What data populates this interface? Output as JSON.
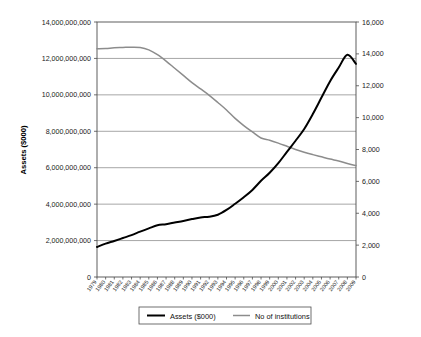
{
  "chart_data": {
    "type": "line",
    "title": "",
    "xlabel": "",
    "ylabel": "Assets ($000)",
    "y2label": "",
    "grid": true,
    "legend_position": "bottom",
    "ylim": [
      0,
      14000000000
    ],
    "y2lim": [
      0,
      16000
    ],
    "categories": [
      "1979",
      "1980",
      "1981",
      "1982",
      "1983",
      "1984",
      "1985",
      "1986",
      "1987",
      "1988",
      "1989",
      "1990",
      "1991",
      "1992",
      "1993",
      "1994",
      "1995",
      "1996",
      "1997",
      "1998",
      "1999",
      "2000",
      "2001",
      "2002",
      "2003",
      "2004",
      "2005",
      "2006",
      "2007",
      "2008",
      "2009"
    ],
    "ytick_labels": [
      "0",
      "2,000,000,000",
      "4,000,000,000",
      "6,000,000,000",
      "8,000,000,000",
      "10,000,000,000",
      "12,000,000,000",
      "14,000,000,000"
    ],
    "ytick_values": [
      0,
      2000000000,
      4000000000,
      6000000000,
      8000000000,
      10000000000,
      12000000000,
      14000000000
    ],
    "y2tick_labels": [
      "0",
      "2,000",
      "4,000",
      "6,000",
      "8,000",
      "10,000",
      "12,000",
      "14,000",
      "16,000"
    ],
    "y2tick_values": [
      0,
      2000,
      4000,
      6000,
      8000,
      10000,
      12000,
      14000,
      16000
    ],
    "series": [
      {
        "name": "Assets ($000)",
        "axis": "left",
        "color": "#000000",
        "values": [
          1650000000,
          1830000000,
          1980000000,
          2140000000,
          2300000000,
          2490000000,
          2670000000,
          2840000000,
          2900000000,
          2990000000,
          3080000000,
          3180000000,
          3270000000,
          3310000000,
          3420000000,
          3680000000,
          4020000000,
          4380000000,
          4780000000,
          5280000000,
          5720000000,
          6250000000,
          6870000000,
          7480000000,
          8130000000,
          8950000000,
          9850000000,
          10750000000,
          11500000000,
          12200000000,
          11700000000
        ]
      },
      {
        "name": "No of institutions",
        "axis": "right",
        "color": "#8c8c8c",
        "values": [
          14320,
          14340,
          14380,
          14400,
          14420,
          14400,
          14250,
          13950,
          13550,
          13100,
          12650,
          12200,
          11800,
          11400,
          10950,
          10480,
          9950,
          9500,
          9100,
          8720,
          8580,
          8400,
          8200,
          8000,
          7830,
          7680,
          7540,
          7400,
          7280,
          7120,
          6990
        ]
      }
    ]
  },
  "legend": {
    "items": [
      {
        "label": "Assets ($000)",
        "color": "#000000"
      },
      {
        "label": "No of institutions",
        "color": "#8c8c8c"
      }
    ]
  }
}
